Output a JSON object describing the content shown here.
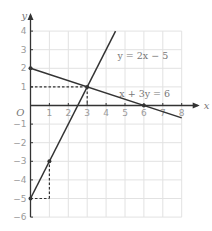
{
  "chart_data": {
    "type": "line",
    "title": "",
    "xlabel": "x",
    "ylabel": "y",
    "origin_label": "O",
    "xlim": [
      0,
      8
    ],
    "ylim": [
      -6,
      4
    ],
    "grid": true,
    "x_ticks": [
      1,
      2,
      3,
      4,
      5,
      6,
      7,
      8
    ],
    "y_ticks": [
      -6,
      -5,
      -4,
      -3,
      -2,
      -1,
      1,
      2,
      3,
      4
    ],
    "series": [
      {
        "name": "y = 2x - 5",
        "label": "y = 2x − 5",
        "x": [
          0,
          4.5
        ],
        "y": [
          -5,
          4
        ],
        "label_at": [
          4.6,
          2.5
        ]
      },
      {
        "name": "x + 3y = 6",
        "label": "x + 3y = 6",
        "x": [
          0,
          8
        ],
        "y": [
          2,
          -0.6667
        ],
        "label_at": [
          4.7,
          0.45
        ]
      }
    ],
    "points": [
      {
        "x": 0,
        "y": 2
      },
      {
        "x": 3,
        "y": 1
      },
      {
        "x": 6,
        "y": 0
      },
      {
        "x": 1,
        "y": -3
      },
      {
        "x": 0,
        "y": -5
      }
    ],
    "guides": [
      {
        "from": [
          0,
          1
        ],
        "to": [
          3,
          1
        ]
      },
      {
        "from": [
          3,
          1
        ],
        "to": [
          3,
          0
        ]
      },
      {
        "from": [
          0,
          -5
        ],
        "to": [
          1,
          -5
        ]
      },
      {
        "from": [
          1,
          -5
        ],
        "to": [
          1,
          -3
        ]
      }
    ],
    "colors": {
      "line": "#333333",
      "grid": "#e2e2e2",
      "axis": "#333333"
    }
  }
}
